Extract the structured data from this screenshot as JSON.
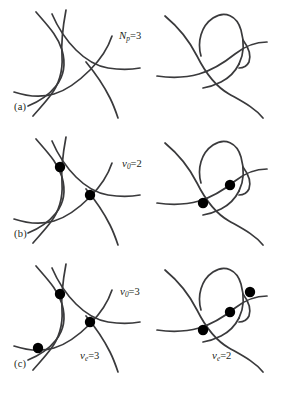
{
  "figure": {
    "stroke_color": "#3a3a3c",
    "dot_color": "#000000",
    "background_color": "#ffffff"
  },
  "rows": [
    {
      "id": "a",
      "panel_label": "(a)",
      "center_label": {
        "symbol": "N",
        "subscript": "p",
        "equals": "=",
        "value": "3"
      },
      "left_panel": {
        "name": "triangle-curves-unmarked",
        "dot_count": 0
      },
      "right_panel": {
        "name": "loop-curves-unmarked",
        "dot_count": 0
      }
    },
    {
      "id": "b",
      "panel_label": "(b)",
      "center_label": {
        "symbol": "v",
        "subscript": "0",
        "equals": "=",
        "value": "2"
      },
      "left_panel": {
        "name": "triangle-curves-two-vertices",
        "dot_count": 2
      },
      "right_panel": {
        "name": "loop-curves-two-vertices",
        "dot_count": 2
      }
    },
    {
      "id": "c",
      "panel_label": "(c)",
      "center_label": {
        "symbol": "v",
        "subscript": "0",
        "equals": "=",
        "value": "3"
      },
      "left_panel": {
        "name": "triangle-curves-three-vertices",
        "dot_count": 3,
        "label": {
          "symbol": "v",
          "subscript": "e",
          "equals": "=",
          "value": "3"
        }
      },
      "right_panel": {
        "name": "loop-curves-three-vertices",
        "dot_count": 3,
        "label": {
          "symbol": "v",
          "subscript": "e",
          "equals": "=",
          "value": "2"
        }
      }
    }
  ]
}
